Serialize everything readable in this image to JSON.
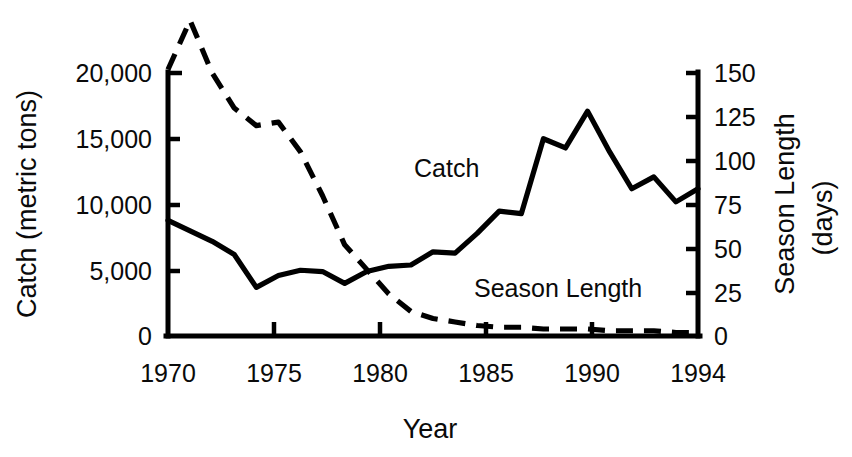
{
  "chart_data": {
    "type": "line",
    "title": "",
    "xlabel": "Year",
    "ylabel": "Catch (metric tons)",
    "y2label_line1": "Season Length",
    "y2label_line2": "(days)",
    "xlim": [
      1970,
      1994
    ],
    "ylim": [
      0,
      20000
    ],
    "y2lim": [
      0,
      150
    ],
    "grid": false,
    "legend_position": "inline-annotations",
    "x_tick_labels": [
      "1970",
      "1975",
      "1980",
      "1985",
      "1990",
      "1994"
    ],
    "x_tick_values": [
      1970,
      1975,
      1980,
      1985,
      1990,
      1994
    ],
    "y_tick_labels": [
      "0",
      "5,000",
      "10,000",
      "15,000",
      "20,000"
    ],
    "y_tick_values": [
      0,
      5000,
      10000,
      15000,
      20000
    ],
    "y2_tick_labels": [
      "0",
      "25",
      "50",
      "75",
      "100",
      "125",
      "150"
    ],
    "y2_tick_values": [
      0,
      25,
      50,
      75,
      100,
      125,
      150
    ],
    "x": [
      1970,
      1971,
      1972,
      1973,
      1974,
      1975,
      1976,
      1977,
      1978,
      1979,
      1980,
      1981,
      1982,
      1983,
      1984,
      1985,
      1986,
      1987,
      1988,
      1989,
      1990,
      1991,
      1992,
      1993,
      1994
    ],
    "series": [
      {
        "name": "Catch",
        "axis": "left",
        "units": "metric tons",
        "style": "solid",
        "label_x": 1981.8,
        "label_y": 12100,
        "values": [
          8800,
          8000,
          7200,
          6200,
          3700,
          4600,
          5000,
          4900,
          4000,
          4900,
          5300,
          5400,
          6400,
          6300,
          7800,
          9500,
          9300,
          15000,
          14300,
          17100,
          14000,
          11200,
          12100,
          10200,
          11200
        ]
      },
      {
        "name": "Season Length",
        "axis": "right",
        "units": "days",
        "style": "dashed",
        "label_x": 1983.0,
        "label_y_days": 27,
        "values": [
          152,
          180,
          150,
          130,
          120,
          122,
          105,
          80,
          52,
          38,
          24,
          14,
          10,
          8,
          6,
          5,
          5,
          4,
          4,
          4,
          3,
          3,
          3,
          2,
          2
        ]
      }
    ],
    "annotations": [
      {
        "text": "Catch",
        "x": 1981.8,
        "y_left": 12100
      },
      {
        "text": "Season Length",
        "x": 1983.0,
        "y_right": 27
      }
    ]
  },
  "axes": {
    "left_title": "Catch (metric tons)",
    "bottom_title": "Year",
    "right_title_line1": "Season Length",
    "right_title_line2": "(days)"
  },
  "colors": {
    "ink": "#000000",
    "background": "#ffffff"
  }
}
